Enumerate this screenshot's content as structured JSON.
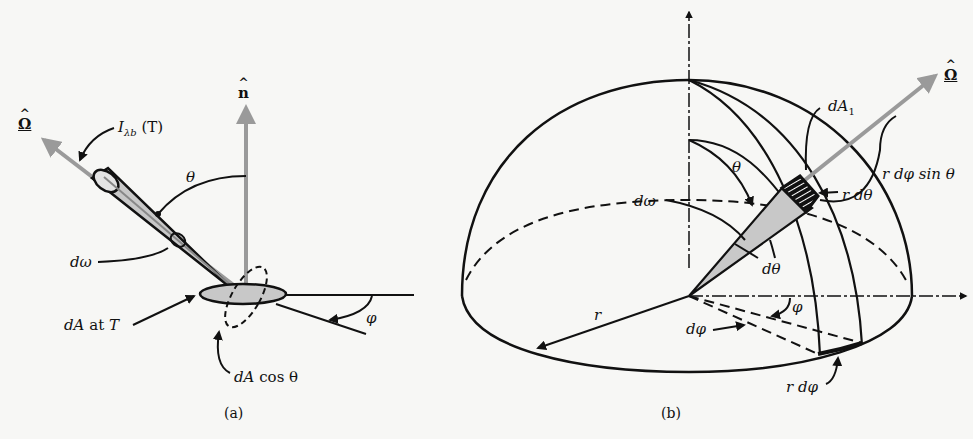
{
  "figure": {
    "panel_a": {
      "caption": "(a)",
      "labels": {
        "omega_hat": "Ω",
        "n_hat": "n",
        "intensity": "I",
        "intensity_sub": "λb",
        "intensity_arg": "(T)",
        "theta": "θ",
        "d_omega": "dω",
        "dA": "dA",
        "dA_at": "at",
        "dA_T": "T",
        "dA_cos": "dA",
        "cos_theta": "cos θ",
        "phi": "φ"
      }
    },
    "panel_b": {
      "caption": "(b)",
      "labels": {
        "omega_hat": "Ω",
        "dA1": "dA",
        "dA1_sub": "1",
        "theta": "θ",
        "r_dphi_sin": "r dφ sin θ",
        "r_dtheta": "r dθ",
        "d_omega": "dω",
        "d_theta": "dθ",
        "r": "r",
        "phi": "φ",
        "d_phi": "dφ",
        "r_dphi": "r dφ"
      }
    },
    "colors": {
      "ink": "#111111",
      "arrow_gray": "#9a9a9a",
      "fill_gray": "#c8c8c8",
      "background": "#f7f7f5"
    }
  }
}
